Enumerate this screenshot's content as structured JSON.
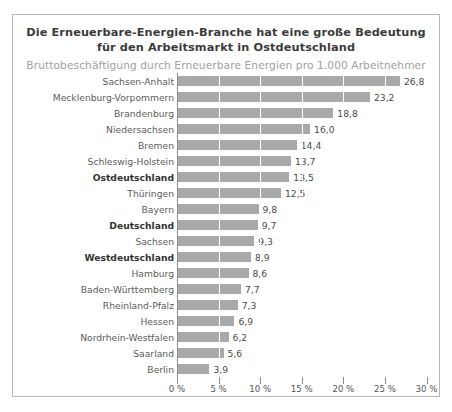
{
  "chart_data": {
    "type": "bar",
    "orientation": "horizontal",
    "title": "Die Erneuerbare-Energien-Branche hat eine große Bedeutung für den Arbeitsmarkt in Ostdeutschland",
    "title_lines": [
      "Die Erneuerbare-Energien-Branche hat eine große Bedeutung",
      "für den Arbeitsmarkt in Ostdeutschland"
    ],
    "subtitle": "Bruttobeschäftigung durch Erneuerbare Energien pro 1.000 Arbeitnehmer",
    "xlabel": "",
    "ylabel": "",
    "xlim": [
      0,
      31.5
    ],
    "grid": true,
    "legend": "none",
    "bar_color": "#a9a9a9",
    "value_format": "comma-decimal",
    "categories": [
      "Sachsen-Anhalt",
      "Mecklenburg-Vorpommern",
      "Brandenburg",
      "Niedersachsen",
      "Bremen",
      "Schleswig-Holstein",
      "Ostdeutschland",
      "Thüringen",
      "Bayern",
      "Deutschland",
      "Sachsen",
      "Westdeutschland",
      "Hamburg",
      "Baden-Württemberg",
      "Rheinland-Pfalz",
      "Hessen",
      "Nordrhein-Westfalen",
      "Saarland",
      "Berlin"
    ],
    "values": [
      26.8,
      23.2,
      18.8,
      16.0,
      14.4,
      13.7,
      13.5,
      12.5,
      9.8,
      9.7,
      9.3,
      8.9,
      8.6,
      7.7,
      7.3,
      6.9,
      6.2,
      5.6,
      3.9
    ],
    "value_labels": [
      "26,8",
      "23,2",
      "18,8",
      "16,0",
      "14,4",
      "13,7",
      "13,5",
      "12,5",
      "9,8",
      "9,7",
      "9,3",
      "8,9",
      "8,6",
      "7,7",
      "7,3",
      "6,9",
      "6,2",
      "5,6",
      "3,9"
    ],
    "emphasized": [
      "Ostdeutschland",
      "Deutschland",
      "Westdeutschland"
    ],
    "xticks": [
      0,
      5,
      10,
      15,
      20,
      25,
      30
    ],
    "xtick_labels": [
      "0 %",
      "5 %",
      "10 %",
      "15 %",
      "20 %",
      "25 %",
      "30 %"
    ]
  },
  "footer": {
    "source_sliver": "&nbsp;"
  }
}
